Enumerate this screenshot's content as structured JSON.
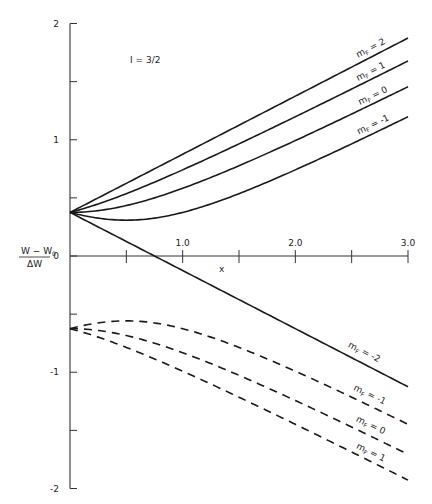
{
  "chart_data": {
    "type": "line",
    "title": "",
    "annotation": "I = 3/2",
    "xlabel": "x",
    "ylabel_numerator": "W - W0",
    "ylabel_denominator": "ΔW",
    "xlim": [
      0,
      3.0
    ],
    "ylim": [
      -2,
      2
    ],
    "x_ticks": [
      0,
      0.5,
      1.0,
      1.5,
      2.0,
      2.5,
      3.0
    ],
    "x_tick_labels": [
      {
        "x": 1.0,
        "label": "1.0"
      },
      {
        "x": 2.0,
        "label": "2.0"
      },
      {
        "x": 3.0,
        "label": "3.0"
      }
    ],
    "y_ticks": [
      -2,
      -1.5,
      -1,
      -0.5,
      0,
      0.5,
      1,
      1.5,
      2
    ],
    "y_tick_labels": [
      {
        "y": 2,
        "label": "2"
      },
      {
        "y": 1,
        "label": "1"
      },
      {
        "y": 0,
        "label": "0"
      },
      {
        "y": -1,
        "label": "-1"
      },
      {
        "y": -2,
        "label": "-2"
      }
    ],
    "grid": false,
    "x": [
      0,
      0.25,
      0.5,
      0.75,
      1.0,
      1.25,
      1.5,
      1.75,
      2.0,
      2.25,
      2.5,
      2.75,
      3.0
    ],
    "series": [
      {
        "name": "mF = 2",
        "style": "solid",
        "values": [
          0.375,
          0.5,
          0.625,
          0.75,
          0.875,
          1.0,
          1.125,
          1.25,
          1.375,
          1.5,
          1.625,
          1.75,
          1.875
        ]
      },
      {
        "name": "mF = 1",
        "style": "solid",
        "values": [
          0.375,
          0.477,
          0.597,
          0.727,
          0.741,
          1.003,
          1.143,
          1.285,
          1.428,
          1.571,
          1.715,
          1.86,
          1.678
        ]
      },
      {
        "name": "mF = 0",
        "style": "solid",
        "values": [
          0.375,
          0.39,
          0.434,
          0.5,
          0.582,
          0.675,
          0.776,
          0.883,
          0.993,
          1.106,
          1.221,
          1.338,
          1.456
        ]
      },
      {
        "name": "mF = -1",
        "style": "solid",
        "values": [
          0.375,
          0.326,
          0.308,
          0.326,
          0.375,
          0.448,
          0.536,
          0.635,
          0.741,
          0.851,
          0.966,
          1.082,
          1.198
        ]
      },
      {
        "name": "mF = -2",
        "style": "solid",
        "values": [
          0.375,
          0.25,
          0.125,
          0.0,
          -0.125,
          -0.25,
          -0.375,
          -0.5,
          -0.625,
          -0.75,
          -0.875,
          -1.0,
          -1.125
        ]
      },
      {
        "name": "mF = -1 (F=1)",
        "style": "dashed",
        "values": [
          -0.625,
          -0.576,
          -0.558,
          -0.576,
          -0.625,
          -0.698,
          -0.786,
          -0.885,
          -0.991,
          -1.101,
          -1.216,
          -1.332,
          -1.448
        ]
      },
      {
        "name": "mF = 0 (F=1)",
        "style": "dashed",
        "values": [
          -0.625,
          -0.64,
          -0.684,
          -0.75,
          -0.832,
          -0.925,
          -1.026,
          -1.133,
          -1.243,
          -1.356,
          -1.471,
          -1.588,
          -1.706
        ]
      },
      {
        "name": "mF = 1 (F=1)",
        "style": "dashed",
        "values": [
          -0.625,
          -0.702,
          -0.787,
          -0.885,
          -0.991,
          -1.103,
          -1.219,
          -1.336,
          -1.456,
          -1.576,
          -1.698,
          -1.82,
          -1.928
        ]
      }
    ],
    "curve_labels": [
      {
        "text": "mF = 2",
        "series": 0
      },
      {
        "text": "mF = 1",
        "series": 1
      },
      {
        "text": "mF = 0",
        "series": 2
      },
      {
        "text": "mF = -1",
        "series": 3
      },
      {
        "text": "mF = -2",
        "series": 4
      },
      {
        "text": "mF = -1",
        "series": 5
      },
      {
        "text": "mF = 0",
        "series": 6
      },
      {
        "text": "mF = 1",
        "series": 7
      }
    ]
  },
  "labels": {
    "annotation": "I = 3/2",
    "x_axis": "x",
    "y_num": "W − W",
    "y_num_sub": "0",
    "y_den": "ΔW",
    "y_zero": "0",
    "m_letter": "m",
    "f_sub": "F"
  }
}
